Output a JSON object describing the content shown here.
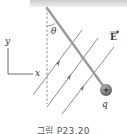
{
  "figure": {
    "caption": "그림 P23.20",
    "labels": {
      "theta": "θ",
      "field": "E",
      "charge": "q",
      "x_axis": "x",
      "y_axis": "y"
    },
    "colors": {
      "ceiling": "#d9dcde",
      "string": "#9a9a9a",
      "field_line": "#6e6e6e",
      "ball": "#7a7a7a",
      "dashed": "#777777"
    }
  }
}
